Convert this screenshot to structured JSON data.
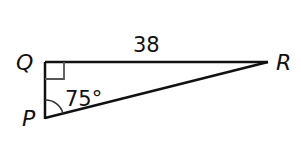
{
  "diagram": {
    "type": "right-triangle",
    "vertices": {
      "Q": {
        "label": "Q",
        "x": 45,
        "y": 62
      },
      "P": {
        "label": "P",
        "x": 45,
        "y": 118
      },
      "R": {
        "label": "R",
        "x": 268,
        "y": 62
      }
    },
    "side_QR": {
      "label": "38"
    },
    "angle_P": {
      "label": "75°"
    },
    "right_angle_at": "Q",
    "colors": {
      "line": "#111111",
      "right_angle_mark": "#555555",
      "background": "#ffffff"
    }
  }
}
